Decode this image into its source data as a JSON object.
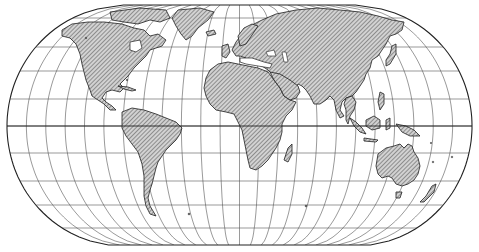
{
  "map": {
    "title": "World map — pseudocylindrical projection with graticule",
    "projection": "Eckert-style (flat poles, elliptical sides)",
    "frame": {
      "width": 479,
      "height": 252
    },
    "extent": {
      "left": 7,
      "right": 472,
      "top": 5,
      "bottom": 245,
      "center_x": 239.5,
      "equator_y": 126
    },
    "pole_line_half_width": 116,
    "graticule": {
      "meridian_step_deg": 15,
      "parallel_step_deg": 15,
      "parallels_y": [
        18,
        47,
        71,
        99,
        126,
        153,
        181,
        205,
        228
      ],
      "equator_emphasized": true
    },
    "style": {
      "land_hatch": "diagonal",
      "land_fill": "#b8b8b8",
      "line_color": "#222222",
      "grid_color": "#555555",
      "background": "#ffffff"
    },
    "continents": [
      {
        "name": "North America"
      },
      {
        "name": "Greenland"
      },
      {
        "name": "South America"
      },
      {
        "name": "Europe"
      },
      {
        "name": "Africa"
      },
      {
        "name": "Madagascar"
      },
      {
        "name": "Asia"
      },
      {
        "name": "Arabia"
      },
      {
        "name": "India"
      },
      {
        "name": "Southeast Asia"
      },
      {
        "name": "Japan"
      },
      {
        "name": "Indonesia"
      },
      {
        "name": "Australia"
      },
      {
        "name": "New Zealand"
      },
      {
        "name": "Great Britain"
      }
    ]
  }
}
